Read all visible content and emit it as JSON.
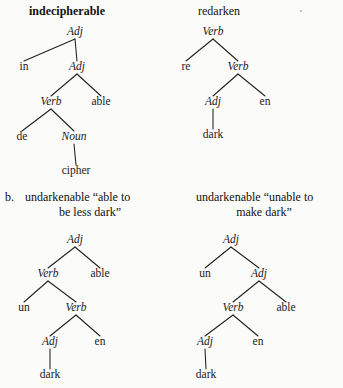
{
  "page": {
    "width": 343,
    "height": 388,
    "background_color": "#fbfbf9",
    "ink_color": "#1a1a1a",
    "item_label": "b."
  },
  "artifacts": {
    "speck_label": "scan-speck"
  },
  "trees": [
    {
      "id": "indecipherable",
      "heading": "indecipherable",
      "heading_bold": true,
      "gloss_lines": [],
      "nodes": [
        {
          "name": "root",
          "label": "Adj",
          "italic": true,
          "x": 75,
          "y": 35
        },
        {
          "name": "prefix-in",
          "label": "in",
          "italic": false,
          "x": 24,
          "y": 70
        },
        {
          "name": "adj-2",
          "label": "Adj",
          "italic": true,
          "x": 77,
          "y": 70
        },
        {
          "name": "verb",
          "label": "Verb",
          "italic": true,
          "x": 51,
          "y": 105
        },
        {
          "name": "suffix-able",
          "label": "able",
          "italic": false,
          "x": 101,
          "y": 105
        },
        {
          "name": "prefix-de",
          "label": "de",
          "italic": false,
          "x": 22,
          "y": 140
        },
        {
          "name": "noun",
          "label": "Noun",
          "italic": true,
          "x": 74,
          "y": 140
        },
        {
          "name": "stem-cipher",
          "label": "cipher",
          "italic": false,
          "x": 76,
          "y": 174
        }
      ],
      "edges": [
        {
          "from": "root",
          "to": "prefix-in"
        },
        {
          "from": "root",
          "to": "adj-2"
        },
        {
          "from": "adj-2",
          "to": "verb"
        },
        {
          "from": "adj-2",
          "to": "suffix-able"
        },
        {
          "from": "verb",
          "to": "prefix-de"
        },
        {
          "from": "verb",
          "to": "noun"
        },
        {
          "from": "noun",
          "to": "stem-cipher"
        }
      ]
    },
    {
      "id": "redarken",
      "heading": "redarken",
      "heading_bold": false,
      "gloss_lines": [],
      "nodes": [
        {
          "name": "root",
          "label": "Verb",
          "italic": true,
          "x": 213,
          "y": 35
        },
        {
          "name": "prefix-re",
          "label": "re",
          "italic": false,
          "x": 186,
          "y": 70
        },
        {
          "name": "verb-2",
          "label": "Verb",
          "italic": true,
          "x": 238,
          "y": 70
        },
        {
          "name": "adj",
          "label": "Adj",
          "italic": true,
          "x": 213,
          "y": 105
        },
        {
          "name": "suffix-en",
          "label": "en",
          "italic": false,
          "x": 265,
          "y": 105
        },
        {
          "name": "stem-dark",
          "label": "dark",
          "italic": false,
          "x": 213,
          "y": 138
        }
      ],
      "edges": [
        {
          "from": "root",
          "to": "prefix-re"
        },
        {
          "from": "root",
          "to": "verb-2"
        },
        {
          "from": "verb-2",
          "to": "adj"
        },
        {
          "from": "verb-2",
          "to": "suffix-en"
        },
        {
          "from": "adj",
          "to": "stem-dark"
        }
      ]
    },
    {
      "id": "undarkenable-able-to-be-less-dark",
      "heading": "",
      "heading_bold": false,
      "gloss_lines": [
        "undarkenable “able to",
        "be less dark”"
      ],
      "nodes": [
        {
          "name": "root",
          "label": "Adj",
          "italic": true,
          "x": 75,
          "y": 243
        },
        {
          "name": "verb-1",
          "label": "Verb",
          "italic": true,
          "x": 48,
          "y": 277
        },
        {
          "name": "suffix-able",
          "label": "able",
          "italic": false,
          "x": 100,
          "y": 277
        },
        {
          "name": "prefix-un",
          "label": "un",
          "italic": false,
          "x": 24,
          "y": 311
        },
        {
          "name": "verb-2",
          "label": "Verb",
          "italic": true,
          "x": 76,
          "y": 311
        },
        {
          "name": "adj",
          "label": "Adj",
          "italic": true,
          "x": 50,
          "y": 345
        },
        {
          "name": "suffix-en",
          "label": "en",
          "italic": false,
          "x": 100,
          "y": 345
        },
        {
          "name": "stem-dark",
          "label": "dark",
          "italic": false,
          "x": 50,
          "y": 378
        }
      ],
      "edges": [
        {
          "from": "root",
          "to": "verb-1"
        },
        {
          "from": "root",
          "to": "suffix-able"
        },
        {
          "from": "verb-1",
          "to": "prefix-un"
        },
        {
          "from": "verb-1",
          "to": "verb-2"
        },
        {
          "from": "verb-2",
          "to": "adj"
        },
        {
          "from": "verb-2",
          "to": "suffix-en"
        },
        {
          "from": "adj",
          "to": "stem-dark"
        }
      ]
    },
    {
      "id": "undarkenable-unable-to-make-dark",
      "heading": "",
      "heading_bold": false,
      "gloss_lines": [
        "undarkenable “unable to",
        "make dark”"
      ],
      "nodes": [
        {
          "name": "root",
          "label": "Adj",
          "italic": true,
          "x": 231,
          "y": 243
        },
        {
          "name": "prefix-un",
          "label": "un",
          "italic": false,
          "x": 205,
          "y": 277
        },
        {
          "name": "adj-2",
          "label": "Adj",
          "italic": true,
          "x": 259,
          "y": 277
        },
        {
          "name": "verb",
          "label": "Verb",
          "italic": true,
          "x": 233,
          "y": 311
        },
        {
          "name": "suffix-able",
          "label": "able",
          "italic": false,
          "x": 286,
          "y": 311
        },
        {
          "name": "adj-3",
          "label": "Adj",
          "italic": true,
          "x": 205,
          "y": 345
        },
        {
          "name": "suffix-en",
          "label": "en",
          "italic": false,
          "x": 258,
          "y": 345
        },
        {
          "name": "stem-dark",
          "label": "dark",
          "italic": false,
          "x": 206,
          "y": 378
        }
      ],
      "edges": [
        {
          "from": "root",
          "to": "prefix-un"
        },
        {
          "from": "root",
          "to": "adj-2"
        },
        {
          "from": "adj-2",
          "to": "verb"
        },
        {
          "from": "adj-2",
          "to": "suffix-able"
        },
        {
          "from": "verb",
          "to": "adj-3"
        },
        {
          "from": "verb",
          "to": "suffix-en"
        },
        {
          "from": "adj-3",
          "to": "stem-dark"
        }
      ]
    }
  ]
}
